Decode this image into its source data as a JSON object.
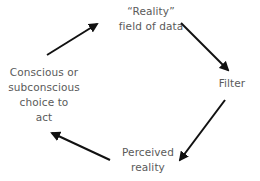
{
  "diagram": {
    "type": "cycle",
    "nodes": [
      {
        "id": "reality",
        "lines": [
          "“Reality”",
          "field of data"
        ]
      },
      {
        "id": "filter",
        "lines": [
          "Filter"
        ]
      },
      {
        "id": "perceived",
        "lines": [
          "Perceived",
          "reality"
        ]
      },
      {
        "id": "choice",
        "lines": [
          "Conscious or",
          "subconscious",
          "choice to",
          "act"
        ]
      }
    ],
    "edges": [
      {
        "from": "choice",
        "to": "reality"
      },
      {
        "from": "reality",
        "to": "filter"
      },
      {
        "from": "filter",
        "to": "perceived"
      },
      {
        "from": "perceived",
        "to": "choice"
      }
    ],
    "colors": {
      "arrow": "#111111",
      "text": "#5a5a5a",
      "background": "#ffffff"
    }
  }
}
